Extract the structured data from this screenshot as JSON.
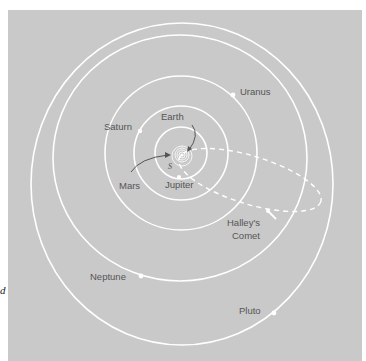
{
  "figure": {
    "background_color": "#c9c9c9",
    "orbit_color": "#ffffff",
    "label_color": "#555555",
    "edge_text_fragment": "d",
    "sun_label": "S",
    "labels": {
      "earth": "Earth",
      "mars": "Mars",
      "jupiter": "Jupiter",
      "saturn": "Saturn",
      "uranus": "Uranus",
      "neptune": "Neptune",
      "pluto": "Pluto",
      "halley_line1": "Halley's",
      "halley_line2": "Comet"
    }
  }
}
